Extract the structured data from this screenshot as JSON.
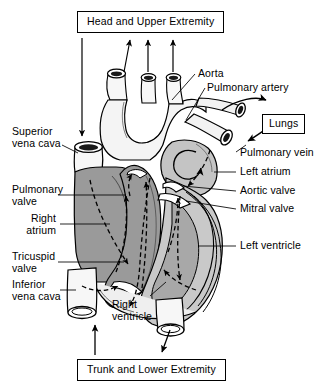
{
  "figure": {
    "type": "anatomical-diagram",
    "background_color": "#ffffff",
    "line_color": "#000000",
    "deoxygenated_fill": "#9a9a9a",
    "oxygenated_fill": "#c9c9c9",
    "vessel_fill": "#f4f4f4",
    "chamber_light_fill": "#ffffff"
  },
  "destination_boxes": [
    {
      "id": "head",
      "label": "Head and Upper Extremity"
    },
    {
      "id": "lungs",
      "label": "Lungs"
    },
    {
      "id": "trunk",
      "label": "Trunk and Lower Extremity"
    }
  ],
  "labels_left": [
    {
      "id": "superior-vena-cava",
      "line1": "Superior",
      "line2": "vena cava"
    },
    {
      "id": "pulmonary-valve",
      "line1": "Pulmonary",
      "line2": "valve"
    },
    {
      "id": "right-atrium",
      "line1": "Right",
      "line2": "atrium"
    },
    {
      "id": "tricuspid-valve",
      "line1": "Tricuspid",
      "line2": "valve"
    },
    {
      "id": "inferior-vena-cava",
      "line1": "Inferior",
      "line2": "vena cava"
    }
  ],
  "labels_right": [
    {
      "id": "aorta",
      "text": "Aorta"
    },
    {
      "id": "pulmonary-artery",
      "text": "Pulmonary artery"
    },
    {
      "id": "pulmonary-vein",
      "text": "Pulmonary vein"
    },
    {
      "id": "left-atrium",
      "text": "Left atrium"
    },
    {
      "id": "aortic-valve",
      "text": "Aortic valve"
    },
    {
      "id": "mitral-valve",
      "text": "Mitral valve"
    },
    {
      "id": "left-ventricle",
      "text": "Left ventricle"
    }
  ],
  "labels_center": [
    {
      "id": "right-ventricle",
      "line1": "Right",
      "line2": "ventricle"
    }
  ],
  "flow_arrows": {
    "description": "Dashed and solid directional arrows indicating blood flow through chambers and great vessels",
    "into_superior_vena_cava": "down",
    "out_of_aortic_branches": "up",
    "out_of_pulmonary_artery_to_lungs": "right",
    "into_pulmonary_vein_from_lungs": "left",
    "into_inferior_vena_cava": "up",
    "out_of_descending_aorta": "down"
  }
}
